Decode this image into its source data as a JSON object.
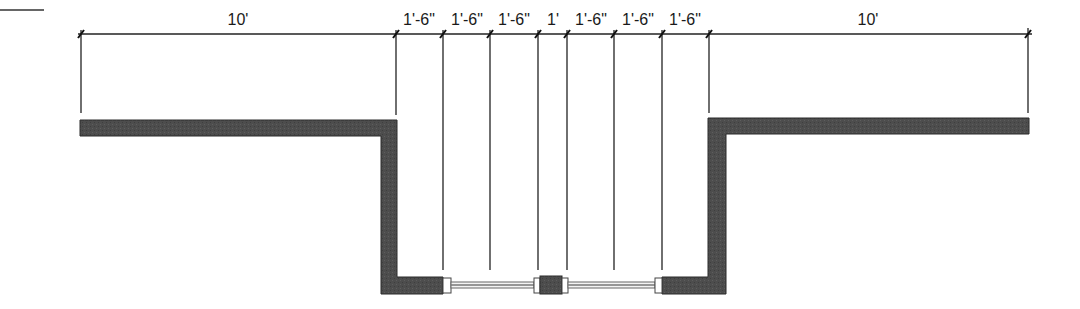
{
  "diagram": {
    "type": "architectural-plan",
    "colors": {
      "wall_fill": "#4a4a4a",
      "wall_stroke": "#2a2a2a",
      "line": "#222222",
      "glass": "#f4f4f4",
      "jamb": "#ffffff"
    },
    "dimensions": [
      {
        "label": "10'",
        "from_x": 81,
        "to_x": 396
      },
      {
        "label": "1'-6\"",
        "from_x": 396,
        "to_x": 443
      },
      {
        "label": "1'-6\"",
        "from_x": 443,
        "to_x": 490
      },
      {
        "label": "1'-6\"",
        "from_x": 490,
        "to_x": 538
      },
      {
        "label": "1'",
        "from_x": 538,
        "to_x": 567
      },
      {
        "label": "1'-6\"",
        "from_x": 567,
        "to_x": 614
      },
      {
        "label": "1'-6\"",
        "from_x": 614,
        "to_x": 662
      },
      {
        "label": "1'-6\"",
        "from_x": 662,
        "to_x": 709
      },
      {
        "label": "10'",
        "from_x": 709,
        "to_x": 1028
      }
    ],
    "labels": {
      "d0": "10'",
      "d1": "1'-6\"",
      "d2": "1'-6\"",
      "d3": "1'-6\"",
      "d4": "1'",
      "d5": "1'-6\"",
      "d6": "1'-6\"",
      "d7": "1'-6\"",
      "d8": "10'"
    },
    "elements": {
      "left_wall": "Left wall segment with recess",
      "right_wall": "Right wall segment with recess",
      "window_left": "Left window unit",
      "window_right": "Right window unit",
      "center_mullion": "Center pier between windows"
    }
  }
}
